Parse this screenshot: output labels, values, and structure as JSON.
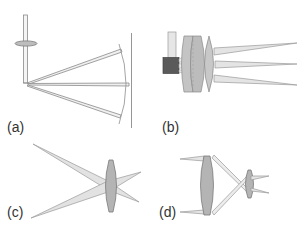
{
  "figure": {
    "panels": [
      {
        "id": "a",
        "label": "(a)",
        "description": "Fiber with collimating element, rays reflected to curved focal surface"
      },
      {
        "id": "b",
        "label": "(b)",
        "description": "Source block with lens stack, three converging ray fans"
      },
      {
        "id": "c",
        "label": "(c)",
        "description": "Single biconvex lens with crossing ray bundles"
      },
      {
        "id": "d",
        "label": "(d)",
        "description": "Two-lens relay with crossing rays"
      }
    ]
  },
  "colors": {
    "background": "#ffffff",
    "line": "#888888",
    "lens_fill": "#b8b8b8",
    "lens_light_fill": "#d4d4d4",
    "ray_fill": "#e4e4e4",
    "ray_stroke": "#9a9a9a",
    "dark_block": "#5a5a5a",
    "label_text": "#333333"
  }
}
